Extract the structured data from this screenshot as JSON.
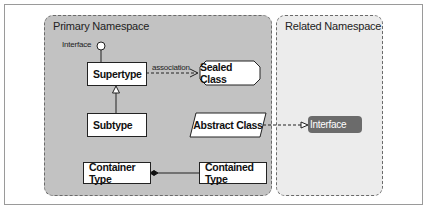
{
  "diagram": {
    "namespaces": {
      "primary": {
        "title": "Primary Namespace"
      },
      "related": {
        "title": "Related Namespace"
      }
    },
    "nodes": {
      "interface_lollipop": {
        "label": "Interface"
      },
      "supertype": {
        "label": "Supertype"
      },
      "subtype": {
        "label": "Subtype"
      },
      "sealed_class": {
        "label": "Sealed Class"
      },
      "abstract_class": {
        "label": "Abstract Class"
      },
      "interface_related": {
        "label": "Interface"
      },
      "container_type": {
        "label": "Container Type"
      },
      "contained_type": {
        "label": "Contained Type"
      }
    },
    "edges": {
      "association": {
        "label": "association",
        "from": "Supertype",
        "to": "Sealed Class",
        "style": "dashed-open-arrow"
      },
      "generalization": {
        "from": "Subtype",
        "to": "Supertype",
        "style": "hollow-triangle"
      },
      "realization": {
        "from": "Abstract Class",
        "to": "Interface",
        "style": "dashed-hollow-arrow"
      },
      "composition": {
        "from": "Contained Type",
        "to": "Container Type",
        "style": "filled-diamond"
      },
      "interface_link": {
        "from": "Supertype",
        "to": "Interface",
        "style": "lollipop"
      }
    },
    "colors": {
      "primary_bg": "#c2c2c2",
      "related_bg": "#ececec",
      "interface_fill": "#6b6b6b"
    }
  }
}
